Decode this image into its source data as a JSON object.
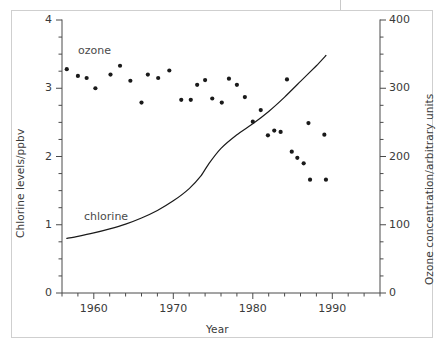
{
  "chart_data": {
    "type": "scatter",
    "title": "",
    "xlabel": "Year",
    "ylabel": "Chlorine levels/ppbv",
    "ylabel_right": "Ozone concentration/arbitrary units",
    "xlim": [
      1956,
      1996
    ],
    "ylim": [
      0,
      4
    ],
    "ylim_right": [
      0,
      400
    ],
    "x_major_ticks": [
      1960,
      1970,
      1980,
      1990
    ],
    "x_major_tick_labels": [
      "1960",
      "1970",
      "1980",
      "1990"
    ],
    "x_minor_tick_step": 2,
    "y_left_major_ticks": [
      0,
      1,
      2,
      3,
      4
    ],
    "y_left_major_tick_labels": [
      "0",
      "1",
      "2",
      "3",
      "4"
    ],
    "y_left_minor_tick_step": 0.25,
    "y_right_major_ticks": [
      0,
      100,
      200,
      300,
      400
    ],
    "y_right_major_tick_labels": [
      "0",
      "100",
      "200",
      "300",
      "400"
    ],
    "y_right_minor_tick_step": 25,
    "grid": false,
    "legend_position": "inline-annotations",
    "series": [
      {
        "name": "ozone",
        "label": "ozone",
        "type": "scatter",
        "axis": "right",
        "marker": "filled-circle",
        "color": "#1a1a1a",
        "points": [
          [
            1956.6,
            328
          ],
          [
            1958.0,
            318
          ],
          [
            1959.1,
            315
          ],
          [
            1960.2,
            300
          ],
          [
            1962.1,
            320
          ],
          [
            1963.3,
            333
          ],
          [
            1964.6,
            311
          ],
          [
            1966.0,
            279
          ],
          [
            1966.8,
            320
          ],
          [
            1968.1,
            315
          ],
          [
            1969.5,
            326
          ],
          [
            1971.0,
            283
          ],
          [
            1972.2,
            283
          ],
          [
            1973.0,
            305
          ],
          [
            1974.0,
            312
          ],
          [
            1974.9,
            285
          ],
          [
            1976.1,
            279
          ],
          [
            1977.0,
            314
          ],
          [
            1978.0,
            305
          ],
          [
            1979.0,
            287
          ],
          [
            1980.0,
            251
          ],
          [
            1981.0,
            268
          ],
          [
            1981.9,
            231
          ],
          [
            1982.7,
            238
          ],
          [
            1983.5,
            236
          ],
          [
            1984.3,
            313
          ],
          [
            1984.9,
            207
          ],
          [
            1985.6,
            198
          ],
          [
            1986.4,
            190
          ],
          [
            1987.0,
            249
          ],
          [
            1987.2,
            166
          ],
          [
            1989.0,
            232
          ],
          [
            1989.2,
            166
          ]
        ]
      },
      {
        "name": "chlorine",
        "label": "chlorine",
        "type": "line",
        "axis": "left",
        "color": "#1a1a1a",
        "points": [
          [
            1956.6,
            0.8
          ],
          [
            1958.0,
            0.83
          ],
          [
            1960.0,
            0.88
          ],
          [
            1962.0,
            0.94
          ],
          [
            1964.0,
            1.01
          ],
          [
            1966.0,
            1.1
          ],
          [
            1968.0,
            1.21
          ],
          [
            1970.0,
            1.35
          ],
          [
            1972.0,
            1.53
          ],
          [
            1973.5,
            1.72
          ],
          [
            1974.5,
            1.9
          ],
          [
            1976.0,
            2.12
          ],
          [
            1978.0,
            2.32
          ],
          [
            1980.0,
            2.48
          ],
          [
            1982.0,
            2.66
          ],
          [
            1984.0,
            2.87
          ],
          [
            1986.0,
            3.1
          ],
          [
            1988.0,
            3.33
          ],
          [
            1989.2,
            3.48
          ]
        ]
      }
    ]
  },
  "labels": {
    "ozone": "ozone",
    "chlorine": "chlorine"
  }
}
